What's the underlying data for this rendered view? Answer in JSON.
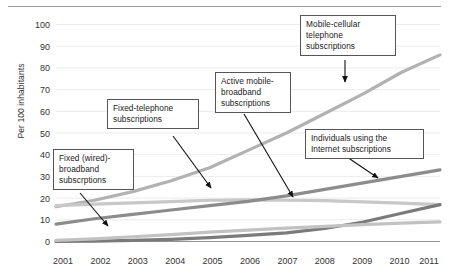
{
  "chart_data": {
    "type": "line",
    "title": "",
    "xlabel": "",
    "ylabel": "Per 100 inhabitants",
    "categories": [
      "2001",
      "2002",
      "2003",
      "2004",
      "2005",
      "2006",
      "2007",
      "2008",
      "2009",
      "2010",
      "2011"
    ],
    "ylim": [
      0,
      100
    ],
    "ytick_labels": [
      "0",
      "10",
      "20",
      "30",
      "40",
      "50",
      "60",
      "70",
      "80",
      "90",
      "100"
    ],
    "grid": true,
    "legend": "callout-labels",
    "series": [
      {
        "name": "Mobile-cellular telephone subscriptions",
        "color": "#b2b2b2",
        "values": [
          16,
          19,
          23,
          28,
          34,
          42,
          50,
          59,
          68,
          78,
          86
        ]
      },
      {
        "name": "Fixed-telephone subscriptions",
        "color": "#c8c8c8",
        "values": [
          16.5,
          17.2,
          17.8,
          18.4,
          19.0,
          19.2,
          19.0,
          18.8,
          18.3,
          17.7,
          17.0
        ]
      },
      {
        "name": "Individuals using the Internet subscriptions",
        "color": "#8c8c8c",
        "values": [
          8,
          10.5,
          12.5,
          14.5,
          16.5,
          18.5,
          21,
          24,
          27,
          30,
          33
        ]
      },
      {
        "name": "Active mobile-broadband subscriptions",
        "color": "#7a7a7a",
        "values": [
          0,
          0.2,
          0.5,
          1.0,
          1.8,
          2.8,
          4.0,
          6.0,
          9.0,
          13.0,
          17.0
        ]
      },
      {
        "name": "Fixed (wired)-broadband subscrptions",
        "color": "#c2c2c2",
        "values": [
          0.5,
          1.2,
          2.2,
          3.2,
          4.3,
          5.2,
          6.2,
          7.0,
          7.8,
          8.5,
          9.0
        ]
      }
    ]
  },
  "axis": {
    "y_label": "Per 100 inhabitants",
    "y_ticks": [
      "100",
      "90",
      "80",
      "70",
      "60",
      "50",
      "40",
      "30",
      "20",
      "10",
      "0"
    ],
    "x_ticks": [
      "2001",
      "2002",
      "2003",
      "2004",
      "2005",
      "2006",
      "2007",
      "2008",
      "2009",
      "2010",
      "2011"
    ]
  },
  "callouts": [
    {
      "id": "mobile-cellular",
      "line1": "Mobile-cellular",
      "line2": "telephone",
      "line3": "subscriptions"
    },
    {
      "id": "active-mobile-broadband",
      "line1": "Active mobile-",
      "line2": "broadband",
      "line3": "subscriptions"
    },
    {
      "id": "fixed-telephone",
      "line1": "Fixed-telephone",
      "line2": "subscriptions",
      "line3": ""
    },
    {
      "id": "individuals-internet",
      "line1": "Individuals using the",
      "line2": "Internet subscriptions",
      "line3": ""
    },
    {
      "id": "fixed-broadband",
      "line1": "Fixed (wired)-",
      "line2": "broadband",
      "line3": "subscrptions"
    }
  ]
}
